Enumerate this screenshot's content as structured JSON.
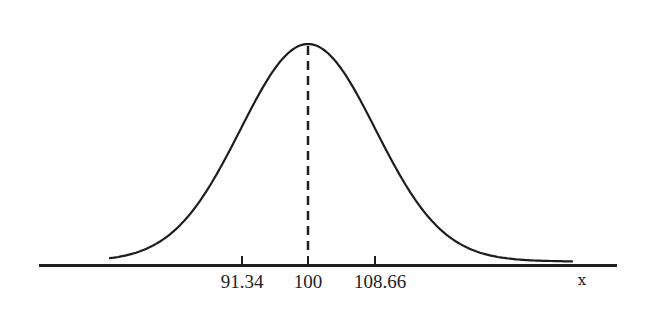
{
  "chart_data": {
    "type": "line",
    "title": "",
    "xlabel": "x",
    "ylabel": "",
    "mean": 100,
    "sd": 8.66,
    "tick_labels": [
      "91.34",
      "100",
      "108.66"
    ],
    "tick_values": [
      91.34,
      100,
      108.66
    ],
    "mean_line": {
      "x": 100,
      "style": "dashed"
    },
    "xlim": [
      74.2,
      113.6
    ],
    "grid": false,
    "legend": null,
    "series": [
      {
        "name": "normal density",
        "curve": "gaussian",
        "mu": 100,
        "sigma": 8.66
      }
    ]
  },
  "labels": {
    "tick_left": "91.34",
    "tick_mid": "100",
    "tick_right": "108.66",
    "axis_x": "x"
  },
  "colors": {
    "ink": "#1e1e1e",
    "background": "#ffffff"
  }
}
